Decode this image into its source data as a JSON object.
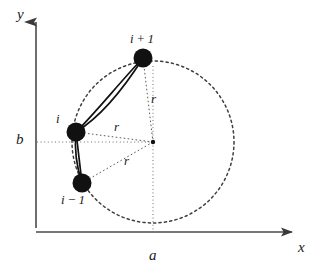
{
  "figure": {
    "type": "geometric-diagram",
    "width": 321,
    "height": 272,
    "background_color": "#ffffff",
    "ink_color": "#1a1a1a",
    "dash_color": "#555555"
  },
  "axes": {
    "x_label": "x",
    "y_label": "y",
    "x_axis": {
      "y": 232,
      "x_start": 36,
      "x_end": 299
    },
    "y_axis": {
      "x": 36,
      "y_start": 228,
      "y_end": 14
    },
    "x_label_pos": {
      "x": 299,
      "y": 241
    },
    "y_label_pos": {
      "x": 17,
      "y": 8
    }
  },
  "coordinate_markers": {
    "a": {
      "label": "a",
      "x": 150,
      "y": 249,
      "guide_x": 153,
      "guide_from_y": 142,
      "guide_to_y": 232
    },
    "b": {
      "label": "b",
      "x": 16,
      "y": 132,
      "guide_y": 142,
      "guide_from_x": 36,
      "guide_to_x": 153
    }
  },
  "circle": {
    "center": {
      "cx": 153,
      "cy": 142
    },
    "radius": 81,
    "stroke_dasharray": "2 3",
    "center_dot_radius": 2.2
  },
  "nodes": [
    {
      "id": "i+1",
      "label": "i + 1",
      "cx": 143,
      "cy": 58,
      "r": 9.5,
      "label_x": 131,
      "label_y": 33
    },
    {
      "id": "i",
      "label": "i",
      "cx": 76,
      "cy": 132,
      "r": 9.5,
      "label_x": 56,
      "label_y": 113
    },
    {
      "id": "i-1",
      "label": "i − 1",
      "cx": 82,
      "cy": 183,
      "r": 9.5,
      "label_x": 62,
      "label_y": 194
    }
  ],
  "radius_labels": [
    {
      "label": "r",
      "x": 151,
      "y": 93,
      "from": "center",
      "to": "i+1"
    },
    {
      "label": "r",
      "x": 114,
      "y": 121,
      "from": "center",
      "to": "i"
    },
    {
      "label": "r",
      "x": 124,
      "y": 155,
      "from": "center",
      "to": "i-1"
    }
  ],
  "chords": [
    {
      "from": "i",
      "to": "i+1",
      "style": "double-solid-arc"
    },
    {
      "from": "i",
      "to": "i-1",
      "style": "double-solid-arc"
    }
  ]
}
